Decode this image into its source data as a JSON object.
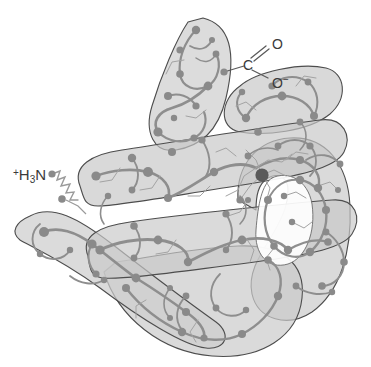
{
  "figure": {
    "kind": "protein-tertiary-structure-diagram",
    "background_color": "#ffffff",
    "width": 371,
    "height": 367
  },
  "labels": {
    "n_terminus": {
      "charge": "+",
      "element": "H",
      "subscript": "3",
      "element2": "N",
      "full_text": "+H3N",
      "description": "amino terminus"
    },
    "c_terminus": {
      "carbon": "C",
      "oxygen_double": "O",
      "oxygen_anion": "O",
      "anion_charge": "−",
      "full_text": "C(=O)O-",
      "description": "carboxyl terminus"
    }
  },
  "palette": {
    "background": "#ffffff",
    "tube_fill": "#c9c9c9",
    "tube_fill_light": "#d8d8d8",
    "tube_outline": "#4a4a4a",
    "backbone_chain": "#8e8e8e",
    "backbone_chain_dark": "#7a7a7a",
    "residue_node": "#8a8a8a",
    "residue_node_dark": "#6d6d6d",
    "heme_iron_node": "#5a5a5a",
    "side_chain_line": "#9b9b9b",
    "label_text": "#3a3a3a"
  },
  "structure": {
    "helix_segments": [
      {
        "name": "helix-a-upper-left",
        "points": [
          [
            205,
            15
          ],
          [
            238,
            26
          ],
          [
            229,
            96
          ],
          [
            198,
            141
          ],
          [
            170,
            150
          ],
          [
            148,
            126
          ],
          [
            160,
            96
          ],
          [
            181,
            48
          ]
        ],
        "width": 46,
        "fill": "#cfcfcf"
      },
      {
        "name": "helix-b-top-right",
        "points": [
          [
            258,
            78
          ],
          [
            322,
            68
          ],
          [
            339,
            88
          ],
          [
            327,
            115
          ],
          [
            269,
            131
          ],
          [
            236,
            132
          ],
          [
            222,
            110
          ],
          [
            235,
            88
          ]
        ],
        "width": 42,
        "fill": "#cbcbcb"
      },
      {
        "name": "helix-c-long-diagonal",
        "points": [
          [
            88,
            166
          ],
          [
            168,
            150
          ],
          [
            250,
            134
          ],
          [
            318,
            122
          ],
          [
            340,
            138
          ],
          [
            330,
            168
          ],
          [
            240,
            188
          ],
          [
            140,
            206
          ],
          [
            95,
            205
          ],
          [
            78,
            187
          ]
        ],
        "width": 40,
        "fill": "#c7c7c7"
      },
      {
        "name": "helix-d-mid-diagonal",
        "points": [
          [
            96,
            238
          ],
          [
            190,
            225
          ],
          [
            280,
            214
          ],
          [
            340,
            208
          ],
          [
            352,
            228
          ],
          [
            338,
            250
          ],
          [
            240,
            264
          ],
          [
            140,
            276
          ],
          [
            100,
            272
          ],
          [
            86,
            255
          ]
        ],
        "width": 40,
        "fill": "#c9c9c9"
      },
      {
        "name": "helix-e-lower-left",
        "points": [
          [
            27,
            222
          ],
          [
            60,
            212
          ],
          [
            120,
            248
          ],
          [
            186,
            292
          ],
          [
            220,
            318
          ],
          [
            210,
            340
          ],
          [
            176,
            338
          ],
          [
            120,
            306
          ],
          [
            62,
            268
          ],
          [
            24,
            248
          ]
        ],
        "width": 42,
        "fill": "#cdcdcd"
      },
      {
        "name": "helix-f-right-loop",
        "points": [
          [
            236,
            185
          ],
          [
            250,
            154
          ],
          [
            282,
            140
          ],
          [
            316,
            146
          ],
          [
            338,
            176
          ],
          [
            340,
            224
          ],
          [
            330,
            268
          ],
          [
            306,
            300
          ],
          [
            276,
            310
          ],
          [
            254,
            292
          ],
          [
            258,
            262
          ],
          [
            276,
            236
          ],
          [
            286,
            208
          ]
        ],
        "width": 44,
        "fill": "#cacaca"
      },
      {
        "name": "helix-g-bottom-center",
        "points": [
          [
            108,
            276
          ],
          [
            150,
            320
          ],
          [
            198,
            350
          ],
          [
            250,
            352
          ],
          [
            286,
            330
          ],
          [
            300,
            296
          ],
          [
            288,
            262
          ],
          [
            250,
            250
          ],
          [
            196,
            256
          ],
          [
            150,
            266
          ]
        ],
        "width": 44,
        "fill": "#cbcbcb"
      }
    ],
    "residue_node_count": 96,
    "heme_iron": {
      "x": 262,
      "y": 175,
      "r": 6.5,
      "color": "#5a5a5a"
    },
    "n_terminus_chain_start": {
      "x": 56,
      "y": 174
    },
    "c_terminus_chain_end": {
      "x": 225,
      "y": 72
    }
  }
}
